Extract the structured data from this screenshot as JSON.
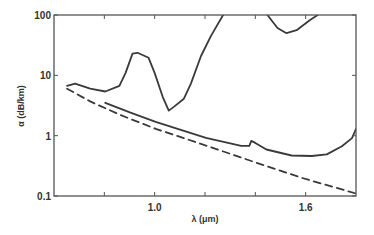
{
  "chart_data": {
    "type": "line",
    "title": "",
    "xlabel": "λ (μm)",
    "ylabel": "α (dB/km)",
    "xlim": [
      0.6,
      1.8
    ],
    "ylim": [
      0.1,
      100
    ],
    "yscale": "log",
    "grid": false,
    "legend": null,
    "x_ticks": [
      0.8,
      1.0,
      1.2,
      1.4,
      1.6
    ],
    "x_tick_labels": [
      {
        "value": 1.0,
        "label": "1.0"
      },
      {
        "value": 1.6,
        "label": "1.6"
      }
    ],
    "y_tick_labels": [
      {
        "value": 100,
        "label": "100"
      },
      {
        "value": 10,
        "label": "10"
      },
      {
        "value": 1,
        "label": "1"
      },
      {
        "value": 0.1,
        "label": "0.1"
      }
    ],
    "series": [
      {
        "name": "high-loss fiber (solid, upper)",
        "style": "solid",
        "x": [
          0.652,
          0.684,
          0.744,
          0.804,
          0.86,
          0.884,
          0.912,
          0.932,
          0.976,
          1.0,
          1.032,
          1.056,
          1.076,
          1.116,
          1.144,
          1.184,
          1.224,
          1.272
        ],
        "y": [
          6.7,
          7.3,
          6.0,
          5.4,
          6.7,
          10.9,
          22.9,
          23.6,
          19.5,
          10.9,
          4.4,
          2.6,
          3.0,
          4.1,
          7.3,
          20.9,
          45.0,
          100
        ]
      },
      {
        "name": "upper-right absorption dip (solid)",
        "style": "solid",
        "x": [
          1.448,
          1.488,
          1.524,
          1.564,
          1.616,
          1.648
        ],
        "y": [
          100,
          61,
          50,
          56,
          82,
          100
        ]
      },
      {
        "name": "low-loss fiber (solid, lower)",
        "style": "solid",
        "x": [
          0.804,
          0.904,
          1.004,
          1.104,
          1.204,
          1.344,
          1.376,
          1.384,
          1.4,
          1.444,
          1.544,
          1.624,
          1.684,
          1.744,
          1.784,
          1.8
        ],
        "y": [
          3.5,
          2.4,
          1.7,
          1.25,
          0.92,
          0.68,
          0.68,
          0.82,
          0.76,
          0.59,
          0.47,
          0.46,
          0.49,
          0.67,
          0.91,
          1.3
        ]
      },
      {
        "name": "Rayleigh scattering limit (dashed)",
        "style": "dashed",
        "x": [
          0.652,
          0.744,
          0.864,
          1.004,
          1.184,
          1.384,
          1.584,
          1.8
        ],
        "y": [
          6.0,
          3.7,
          2.2,
          1.3,
          0.73,
          0.38,
          0.2,
          0.11
        ]
      }
    ]
  },
  "axes": {
    "x_label": "λ (μm)",
    "y_label": "α (dB/km)"
  }
}
